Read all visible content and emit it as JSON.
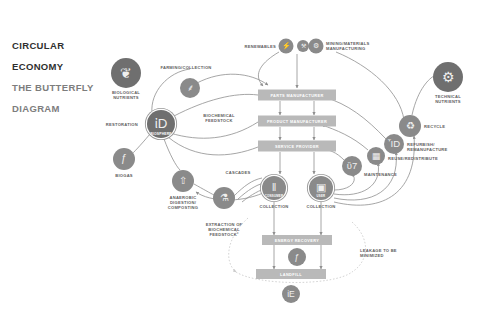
{
  "title": {
    "line1": "CIRCULAR",
    "line2": "ECONOMY",
    "line3": "THE BUTTERFLY",
    "line4": "DIAGRAM"
  },
  "colors": {
    "node_fill": "#8a8a8a",
    "node_fill_dark": "#6f6f6f",
    "box_fill": "#b9b9b9",
    "label_text": "#5e5e5e",
    "box_text": "#ffffff",
    "wire": "#8f8f8f",
    "background": "#ffffff",
    "title_dark": "#2f2f2f",
    "title_light": "#7d7d7d"
  },
  "nodes": [
    {
      "id": "biological-nutrients",
      "label": "BIOLOGICAL\nNUTRIENTS",
      "icon": "leaf-icon",
      "glyph": "❦",
      "x": 126,
      "y": 73,
      "r": 15,
      "label_x": 126,
      "label_y": 90,
      "label_align": "center",
      "caption": ""
    },
    {
      "id": "farming-collection",
      "label": "FARMING/COLLECTION",
      "icon": "wheat-icon",
      "glyph": "⸙",
      "x": 190,
      "y": 88,
      "r": 10,
      "label_x": 186,
      "label_y": 65,
      "label_align": "center",
      "caption": ""
    },
    {
      "id": "biosphere",
      "label": "",
      "icon": "globe-icon",
      "glyph": "ἰD",
      "x": 161,
      "y": 124,
      "r": 14,
      "label_x": 161,
      "label_y": 121,
      "label_align": "center",
      "caption": "BIOSPHERE"
    },
    {
      "id": "restoration",
      "label": "RESTORATION",
      "icon": "text-only",
      "glyph": "",
      "x": 0,
      "y": 0,
      "r": 0,
      "label_x": 138,
      "label_y": 122,
      "label_align": "left",
      "caption": ""
    },
    {
      "id": "biogas",
      "label": "BIOGAS",
      "icon": "flame-icon",
      "glyph": "ƒ",
      "x": 124,
      "y": 159,
      "r": 11,
      "label_x": 124,
      "label_y": 173,
      "label_align": "center",
      "caption": ""
    },
    {
      "id": "anaerobic-digestion",
      "label": "ANAEROBIC\nDIGESTION/\nCOMPOSTING",
      "icon": "recycle-arrow-icon",
      "glyph": "⇧",
      "x": 183,
      "y": 181,
      "r": 11,
      "label_x": 183,
      "label_y": 195,
      "label_align": "center",
      "caption": ""
    },
    {
      "id": "extraction-biochemical",
      "label": "EXTRACTION OF\nBIOCHEMICAL\nFEEDSTOCK²",
      "icon": "flask-icon",
      "glyph": "⚗",
      "x": 224,
      "y": 198,
      "r": 11,
      "label_x": 224,
      "label_y": 222,
      "label_align": "center",
      "caption": ""
    },
    {
      "id": "biochemical-feedstock",
      "label": "BIOCHEMICAL\nFEEDSTOCK",
      "icon": "text-only",
      "glyph": "",
      "x": 0,
      "y": 0,
      "r": 0,
      "label_x": 219,
      "label_y": 113,
      "label_align": "center",
      "caption": ""
    },
    {
      "id": "cascades",
      "label": "CASCADES",
      "icon": "text-only",
      "glyph": "",
      "x": 0,
      "y": 0,
      "r": 0,
      "label_x": 238,
      "label_y": 170,
      "label_align": "center",
      "caption": ""
    },
    {
      "id": "renewables",
      "label": "RENEWABLES",
      "icon": "power-icon",
      "glyph": "⚡",
      "x": 286,
      "y": 46,
      "r": 7.5,
      "label_x": 276,
      "label_y": 44,
      "label_align": "left",
      "caption": ""
    },
    {
      "id": "finite-materials",
      "label": "",
      "icon": "oil-rig-icon",
      "glyph": "⚒",
      "x": 303,
      "y": 46,
      "r": 6,
      "label_x": 303,
      "label_y": 46,
      "label_align": "center",
      "caption": ""
    },
    {
      "id": "mining-materials",
      "label": "MINING/MATERIALS\nMANUFACTURING",
      "icon": "factory-icon",
      "glyph": "⚙",
      "x": 316,
      "y": 46,
      "r": 7.5,
      "label_x": 326,
      "label_y": 41,
      "label_align": "right",
      "caption": ""
    },
    {
      "id": "technical-nutrients",
      "label": "TECHNICAL\nNUTRIENTS",
      "icon": "gear-icon",
      "glyph": "⚙",
      "x": 448,
      "y": 77,
      "r": 15,
      "label_x": 448,
      "label_y": 94,
      "label_align": "center",
      "caption": ""
    },
    {
      "id": "recycle",
      "label": "RECYCLE",
      "icon": "recycle-icon",
      "glyph": "♻",
      "x": 410,
      "y": 126,
      "r": 11,
      "label_x": 424,
      "label_y": 124,
      "label_align": "right",
      "caption": ""
    },
    {
      "id": "refurbish",
      "label": "REFURBISH/\nREMANUFACTURE",
      "icon": "factory-icon",
      "glyph": "ἾD",
      "x": 394,
      "y": 144,
      "r": 10,
      "label_x": 407,
      "label_y": 142,
      "label_align": "right",
      "caption": ""
    },
    {
      "id": "reuse-redistribute",
      "label": "REUSE/REDISTRIBUTE",
      "icon": "box-icon",
      "glyph": "▦",
      "x": 376,
      "y": 156,
      "r": 9,
      "label_x": 388,
      "label_y": 156,
      "label_align": "right",
      "caption": ""
    },
    {
      "id": "maintenance",
      "label": "MAINTENANCE",
      "icon": "wrench-icon",
      "glyph": "ὒ7",
      "x": 352,
      "y": 166,
      "r": 10,
      "label_x": 364,
      "label_y": 172,
      "label_align": "right",
      "caption": ""
    },
    {
      "id": "consumer",
      "label": "COLLECTION",
      "icon": "barcode-icon",
      "glyph": "‖",
      "x": 274,
      "y": 188,
      "r": 12,
      "label_x": 274,
      "label_y": 204,
      "label_align": "center",
      "caption": "CONSUMER"
    },
    {
      "id": "user",
      "label": "COLLECTION",
      "icon": "monitor-icon",
      "glyph": "▣",
      "x": 321,
      "y": 188,
      "r": 12,
      "label_x": 321,
      "label_y": 204,
      "label_align": "center",
      "caption": "USER"
    },
    {
      "id": "energy-recovery-icon",
      "label": "",
      "icon": "flame-icon",
      "glyph": "ƒ",
      "x": 297,
      "y": 257,
      "r": 9,
      "label_x": 297,
      "label_y": 257,
      "label_align": "center",
      "caption": ""
    },
    {
      "id": "landfill-icon",
      "label": "",
      "icon": "earth-icon",
      "glyph": "ἰE",
      "x": 291,
      "y": 294,
      "r": 9,
      "label_x": 291,
      "label_y": 294,
      "label_align": "center",
      "caption": ""
    }
  ],
  "boxes": [
    {
      "id": "parts-manufacturer",
      "label": "PARTS MANUFACTURER",
      "x": 297,
      "y": 95,
      "w": 78,
      "h": 11
    },
    {
      "id": "product-manufacturer",
      "label": "PRODUCT MANUFACTURER",
      "x": 297,
      "y": 121,
      "w": 78,
      "h": 11
    },
    {
      "id": "service-provider",
      "label": "SERVICE PROVIDER",
      "x": 297,
      "y": 146,
      "w": 78,
      "h": 11
    },
    {
      "id": "energy-recovery",
      "label": "ENERGY RECOVERY",
      "x": 297,
      "y": 240,
      "w": 70,
      "h": 10
    },
    {
      "id": "landfill",
      "label": "LANDFILL",
      "x": 291,
      "y": 274,
      "w": 70,
      "h": 10
    }
  ],
  "annotations": [
    {
      "id": "leakage",
      "label": "LEAKAGE TO BE\nMINIMIZED",
      "x": 360,
      "y": 248,
      "align": "right"
    }
  ]
}
